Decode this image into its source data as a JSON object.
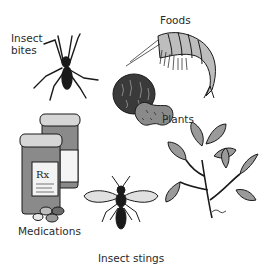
{
  "figure": {
    "labels": {
      "insect_bites": [
        "Insect",
        "bites"
      ],
      "foods": "Foods",
      "plants": "Plants",
      "medications": "Medications",
      "insect_stings": "Insect stings"
    },
    "medication_label_text": "Rx"
  },
  "colors": {
    "ink": "#1a1a1a",
    "mid_gray": "#8a8a8a",
    "light_gray": "#cfcfcf",
    "dark_gray": "#4a4a4a",
    "background": "#ffffff"
  }
}
